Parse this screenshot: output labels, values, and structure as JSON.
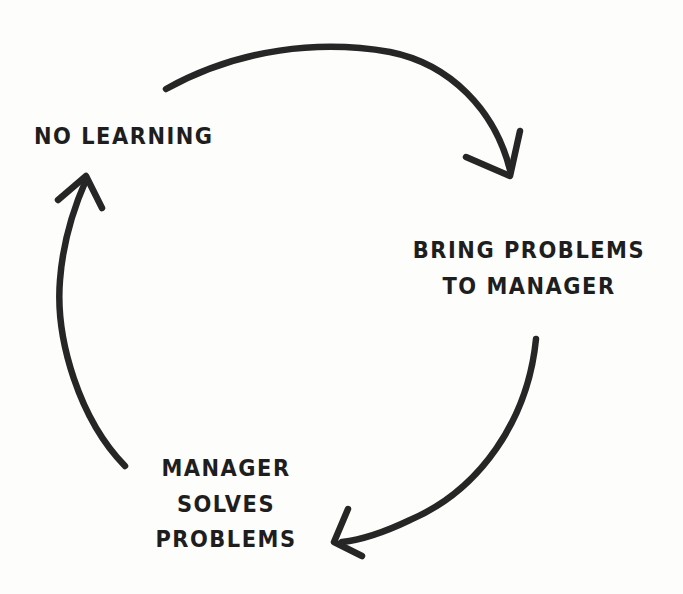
{
  "diagram": {
    "type": "cycle",
    "nodes": [
      {
        "id": "no-learning",
        "lines": [
          "NO LEARNING"
        ]
      },
      {
        "id": "bring-problems",
        "lines": [
          "BRING PROBLEMS",
          "TO MANAGER"
        ]
      },
      {
        "id": "manager-solves",
        "lines": [
          "MANAGER",
          "SOLVES",
          "PROBLEMS"
        ]
      }
    ],
    "edges": [
      {
        "from": "no-learning",
        "to": "bring-problems"
      },
      {
        "from": "bring-problems",
        "to": "manager-solves"
      },
      {
        "from": "manager-solves",
        "to": "no-learning"
      }
    ],
    "colors": {
      "ink": "#262626",
      "background": "#fdfdfb"
    }
  }
}
